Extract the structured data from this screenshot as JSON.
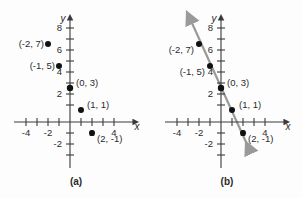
{
  "figure": {
    "panels": [
      {
        "id": "a",
        "caption": "(a)",
        "has_line": false,
        "axis": {
          "x_name": "x",
          "y_name": "y",
          "x_labels": [
            "-4",
            "-2",
            "2",
            "4"
          ],
          "y_labels": [
            "8",
            "6",
            "4",
            "2",
            "-2"
          ],
          "x_tick_values": [
            -4,
            -3,
            -2,
            -1,
            1,
            2,
            3,
            4
          ],
          "y_tick_values": [
            8,
            7,
            6,
            5,
            4,
            3,
            2,
            1,
            -1,
            -2,
            -3
          ],
          "x_range": [
            -5,
            5
          ],
          "y_range": [
            -3.5,
            9
          ]
        },
        "points": [
          {
            "label": "(-2, 7)",
            "x": -2,
            "y": 7,
            "label_pos": "left"
          },
          {
            "label": "(-1, 5)",
            "x": -1,
            "y": 5,
            "label_pos": "left"
          },
          {
            "label": "(0, 3)",
            "x": 0,
            "y": 3,
            "label_pos": "right"
          },
          {
            "label": "(1, 1)",
            "x": 1,
            "y": 1,
            "label_pos": "right"
          },
          {
            "label": "(2, -1)",
            "x": 2,
            "y": -1,
            "label_pos": "below-right"
          }
        ]
      },
      {
        "id": "b",
        "caption": "(b)",
        "has_line": true,
        "line": {
          "slope": -2,
          "intercept": 3,
          "color": "#9a9a9a",
          "arrows": "both"
        },
        "axis": {
          "x_name": "x",
          "y_name": "y",
          "x_labels": [
            "-4",
            "-2",
            "2",
            "4"
          ],
          "y_labels": [
            "8",
            "6",
            "4",
            "2",
            "-2"
          ],
          "x_tick_values": [
            -4,
            -3,
            -2,
            -1,
            1,
            2,
            3,
            4
          ],
          "y_tick_values": [
            8,
            7,
            6,
            5,
            4,
            3,
            2,
            1,
            -1,
            -2,
            -3
          ],
          "x_range": [
            -5,
            5
          ],
          "y_range": [
            -3.5,
            9
          ]
        },
        "points": [
          {
            "label": "(-2, 7)",
            "x": -2,
            "y": 7,
            "label_pos": "left"
          },
          {
            "label": "(-1, 5)",
            "x": -1,
            "y": 5,
            "label_pos": "left"
          },
          {
            "label": "(0, 3)",
            "x": 0,
            "y": 3,
            "label_pos": "right"
          },
          {
            "label": "(1, 1)",
            "x": 1,
            "y": 1,
            "label_pos": "right"
          },
          {
            "label": "(2, -1)",
            "x": 2,
            "y": -1,
            "label_pos": "below-right"
          }
        ]
      }
    ]
  }
}
